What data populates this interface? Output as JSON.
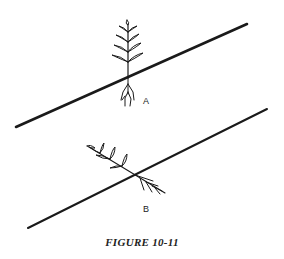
{
  "figure": {
    "caption": "FIGURE 10-11",
    "panels": [
      {
        "label": "A",
        "description": "Plant upright, perpendicular to horizontal, crossing a sloped line"
      },
      {
        "label": "B",
        "description": "Plant tilted, lying along direction crossing a sloped line"
      }
    ],
    "colors": {
      "ink": "#1a1a1a",
      "background": "#ffffff"
    }
  }
}
